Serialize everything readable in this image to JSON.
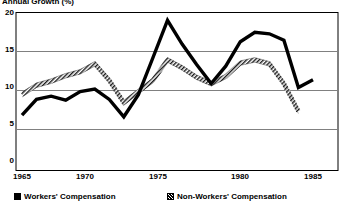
{
  "chart_data": {
    "type": "line",
    "title": "Annual Growth (%)",
    "xlabel": "",
    "ylabel": "",
    "xlim": [
      1965,
      1985
    ],
    "ylim": [
      0,
      20
    ],
    "yticks": [
      0,
      5,
      10,
      15,
      20
    ],
    "xticks": [
      1965,
      1970,
      1975,
      1980,
      1985
    ],
    "grid": true,
    "legend_position": "bottom",
    "x": [
      1965,
      1966,
      1967,
      1968,
      1969,
      1970,
      1971,
      1972,
      1973,
      1974,
      1975,
      1976,
      1977,
      1978,
      1979,
      1980,
      1981,
      1982,
      1983,
      1984,
      1985
    ],
    "series": [
      {
        "name": "Workers' Compensation",
        "style": "solid-thick-black",
        "color": "#000000",
        "values": [
          7.0,
          9.0,
          9.4,
          8.9,
          10.0,
          10.3,
          9.0,
          6.8,
          9.6,
          14.3,
          19.0,
          16.0,
          13.4,
          11.0,
          13.2,
          16.3,
          17.5,
          17.3,
          16.5,
          10.5,
          11.5
        ]
      },
      {
        "name": "Non-Workers' Compensation",
        "style": "hatched-grey",
        "color": "#808080",
        "values": [
          9.6,
          10.8,
          11.3,
          12.0,
          12.5,
          13.5,
          11.4,
          8.6,
          10.0,
          11.4,
          14.0,
          13.0,
          11.8,
          11.0,
          11.9,
          13.6,
          14.0,
          13.5,
          11.0,
          7.5,
          null
        ]
      }
    ]
  },
  "axis": {
    "y_labels": [
      "20",
      "15",
      "10",
      "5",
      "0"
    ],
    "x_labels": [
      "1965",
      "1970",
      "1975",
      "1980",
      "1985"
    ]
  },
  "legend": {
    "items": [
      {
        "label": "Workers' Compensation",
        "swatch": "solid-square-icon"
      },
      {
        "label": "Non-Workers' Compensation",
        "swatch": "hatched-square-icon"
      }
    ]
  }
}
